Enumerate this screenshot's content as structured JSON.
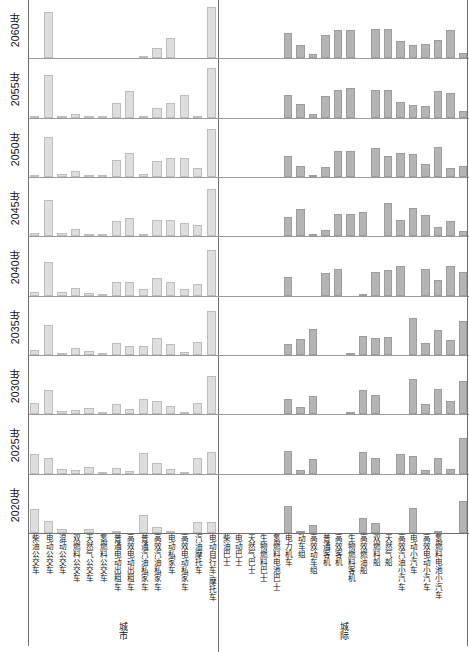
{
  "chart_data": {
    "type": "bar",
    "title": "",
    "xlabel": "",
    "ylabel": "",
    "orientation": "faceted-grid",
    "grid": false,
    "legend": "none",
    "facet_rows_label": "年份",
    "facet_rows": [
      "2060年",
      "2055年",
      "2050年",
      "2045年",
      "2040年",
      "2035年",
      "2030年",
      "2025年",
      "2020年"
    ],
    "panels": [
      {
        "name": "城市",
        "bar_color": "#dedede",
        "categories": [
          "柴油公交车",
          "电动公交车",
          "混动公交车",
          "双燃料公交车",
          "天然气公交车",
          "氢燃料公交车",
          "普通电动出租车",
          "高效电动出租车",
          "普通汽油私家车",
          "高效汽油私家车",
          "电动私家车",
          "高效电动私家车",
          "汽油摩托车",
          "电动自行车/摩托车"
        ],
        "ylim": [
          0,
          100
        ],
        "series": [
          {
            "name": "2060年",
            "values": [
              0,
              86,
              0,
              0,
              0,
              0,
              0,
              0,
              4,
              20,
              38,
              0,
              0,
              95
            ]
          },
          {
            "name": "2055年",
            "values": [
              2,
              80,
              3,
              6,
              2,
              2,
              28,
              50,
              2,
              18,
              27,
              42,
              4,
              92
            ]
          },
          {
            "name": "2050年",
            "values": [
              4,
              74,
              6,
              12,
              4,
              4,
              32,
              44,
              5,
              30,
              35,
              35,
              17,
              90
            ]
          },
          {
            "name": "2045年",
            "values": [
              6,
              68,
              6,
              14,
              5,
              4,
              28,
              34,
              5,
              30,
              30,
              24,
              22,
              88
            ]
          },
          {
            "name": "2040年",
            "values": [
              6,
              62,
              6,
              14,
              5,
              3,
              26,
              26,
              12,
              32,
              26,
              12,
              22,
              86
            ]
          },
          {
            "name": "2035年",
            "values": [
              10,
              55,
              4,
              13,
              8,
              3,
              22,
              17,
              17,
              32,
              20,
              5,
              24,
              82
            ]
          },
          {
            "name": "2030年",
            "values": [
              22,
              46,
              7,
              8,
              11,
              2,
              20,
              10,
              28,
              24,
              16,
              2,
              22,
              72
            ]
          },
          {
            "name": "2025年",
            "values": [
              36,
              30,
              9,
              6,
              13,
              1,
              10,
              4,
              38,
              20,
              9,
              1,
              30,
              40
            ]
          },
          {
            "name": "2020年",
            "values": [
              44,
              22,
              8,
              0,
              7,
              0,
              3,
              0,
              34,
              11,
              4,
              0,
              20,
              20
            ]
          }
        ]
      },
      {
        "name": "城际",
        "bar_color": "#b4b4b4",
        "categories": [
          "柴油巴士",
          "电动巴士",
          "天然气巴士",
          "生物燃料巴士",
          "氢燃料电池巴士",
          "电力机车",
          "动车组",
          "高效动车组",
          "普通客机",
          "高效客机",
          "生物燃料客机",
          "高效燃油船",
          "双燃料船",
          "天然气船",
          "高效汽油小汽车",
          "电动小汽车",
          "高效电动小汽车",
          "氢燃料电池小汽车"
        ],
        "ylim": [
          0,
          100
        ],
        "series": [
          {
            "name": "2060年",
            "values": [
              0,
              0,
              0,
              0,
              0,
              48,
              25,
              8,
              44,
              52,
              52,
              0,
              54,
              54,
              32,
              24,
              26,
              34,
              52,
              10
            ]
          },
          {
            "name": "2055年",
            "values": [
              0,
              0,
              0,
              0,
              0,
              42,
              26,
              6,
              40,
              52,
              56,
              0,
              52,
              52,
              30,
              24,
              22,
              50,
              46,
              12
            ]
          },
          {
            "name": "2050年",
            "values": [
              0,
              0,
              0,
              0,
              0,
              40,
              20,
              4,
              18,
              48,
              48,
              0,
              54,
              40,
              44,
              42,
              24,
              56,
              16,
              20
            ]
          },
          {
            "name": "2045年",
            "values": [
              0,
              0,
              0,
              0,
              0,
              36,
              50,
              3,
              12,
              42,
              42,
              46,
              0,
              62,
              30,
              52,
              40,
              18,
              28,
              10
            ]
          },
          {
            "name": "2040年",
            "values": [
              0,
              0,
              0,
              0,
              0,
              34,
              0,
              0,
              42,
              50,
              0,
              2,
              44,
              48,
              56,
              0,
              50,
              30,
              56,
              44
            ]
          },
          {
            "name": "2035年",
            "values": [
              0,
              0,
              0,
              0,
              0,
              20,
              30,
              48,
              0,
              0,
              2,
              36,
              32,
              34,
              0,
              68,
              22,
              46,
              28,
              64
            ]
          },
          {
            "name": "2030年",
            "values": [
              0,
              0,
              0,
              0,
              0,
              28,
              14,
              34,
              0,
              0,
              1,
              46,
              36,
              0,
              0,
              66,
              20,
              48,
              24,
              62
            ]
          },
          {
            "name": "2025年",
            "values": [
              0,
              0,
              0,
              0,
              0,
              42,
              6,
              28,
              0,
              0,
              0,
              40,
              30,
              0,
              36,
              32,
              6,
              30,
              8,
              66
            ]
          },
          {
            "name": "2020年",
            "values": [
              0,
              0,
              0,
              0,
              0,
              50,
              2,
              14,
              0,
              0,
              0,
              28,
              18,
              0,
              0,
              46,
              0,
              4,
              0,
              60
            ]
          }
        ]
      }
    ]
  },
  "axis": {
    "year_label_suffix": "年"
  }
}
